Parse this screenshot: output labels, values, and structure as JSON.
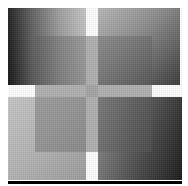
{
  "figure": {
    "description": "Abstract grayscale composition: four gradient squares in a 2x2 grid separated by white gutters, overlaid by a translucent central square, with a black rule along the bottom",
    "colors": {
      "background": "#ffffff",
      "top_left_gradient": [
        "#161616",
        "#c4c4c4"
      ],
      "top_right_gradient": [
        "#b8b8b8",
        "#3a3a3a"
      ],
      "bottom_left_gradient": [
        "#c6c6c6",
        "#9c9c9c"
      ],
      "bottom_right_gradient": [
        "#7a7a7a",
        "#1a1a1a"
      ],
      "overlay": "#5a5a5a",
      "baseline": "#000000"
    },
    "tiles": [
      {
        "position": "top-left"
      },
      {
        "position": "top-right"
      },
      {
        "position": "bottom-left"
      },
      {
        "position": "bottom-right"
      }
    ]
  }
}
